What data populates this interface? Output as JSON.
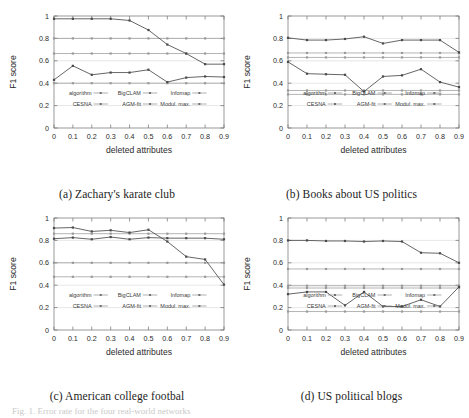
{
  "figure": {
    "caption": "Fig. 1. Error rate for the four real-world networks",
    "legend": {
      "entries": [
        {
          "id": "algorithm",
          "label": "algorithm"
        },
        {
          "id": "bigclam",
          "label": "BigCLAM"
        },
        {
          "id": "infomap",
          "label": "Infomap"
        },
        {
          "id": "cesna",
          "label": "CESNA"
        },
        {
          "id": "agmfit",
          "label": "AGM-fit"
        },
        {
          "id": "modulmax",
          "label": "Modul. max."
        }
      ]
    },
    "axis": {
      "xlabel": "deleted attributes",
      "ylabel": "F1 score",
      "xticks": [
        "0",
        "0.1",
        "0.2",
        "0.3",
        "0.4",
        "0.5",
        "0.6",
        "0.7",
        "0.8",
        "0.9"
      ],
      "yticks": [
        "0",
        "0.2",
        "0.4",
        "0.6",
        "0.8",
        "1"
      ]
    },
    "colors": {
      "line": "#4a4a4a",
      "frame": "#6e6e6e",
      "grid": "#cfcfcf",
      "text": "#2b2b2b"
    }
  },
  "chart_data": [
    {
      "type": "line",
      "panel": "a",
      "title": "(a) Zachary's karate club",
      "xlabel": "deleted attributes",
      "ylabel": "F1 score",
      "x": [
        0,
        0.1,
        0.2,
        0.3,
        0.4,
        0.5,
        0.6,
        0.7,
        0.8,
        0.9
      ],
      "xlim": [
        0,
        0.9
      ],
      "ylim": [
        0,
        1
      ],
      "grid": true,
      "legend_position": "inside-bottom",
      "series": [
        {
          "name": "CESNA",
          "values": [
            0.975,
            0.975,
            0.975,
            0.975,
            0.96,
            0.875,
            0.745,
            0.665,
            0.57,
            0.57
          ]
        },
        {
          "name": "BigCLAM",
          "values": [
            0.43,
            0.555,
            0.475,
            0.495,
            0.495,
            0.52,
            0.41,
            0.45,
            0.46,
            0.455
          ]
        },
        {
          "name": "AGM-fit",
          "values": [
            0.665,
            0.665,
            0.665,
            0.665,
            0.665,
            0.665,
            0.665,
            0.665,
            0.665,
            0.665
          ]
        },
        {
          "name": "Infomap",
          "values": [
            0.8,
            0.8,
            0.8,
            0.8,
            0.8,
            0.8,
            0.8,
            0.8,
            0.8,
            0.8
          ]
        },
        {
          "name": "Modul. max.",
          "values": [
            0.4,
            0.4,
            0.4,
            0.4,
            0.4,
            0.4,
            0.4,
            0.4,
            0.4,
            0.4
          ]
        }
      ]
    },
    {
      "type": "line",
      "panel": "b",
      "title": "(b) Books about US politics",
      "xlabel": "deleted attributes",
      "ylabel": "F1 score",
      "x": [
        0,
        0.1,
        0.2,
        0.3,
        0.4,
        0.5,
        0.6,
        0.7,
        0.8,
        0.9
      ],
      "xlim": [
        0,
        0.9
      ],
      "ylim": [
        0,
        1
      ],
      "grid": true,
      "legend_position": "inside-bottom",
      "series": [
        {
          "name": "CESNA",
          "values": [
            0.805,
            0.785,
            0.785,
            0.795,
            0.815,
            0.755,
            0.785,
            0.785,
            0.785,
            0.675
          ]
        },
        {
          "name": "BigCLAM",
          "values": [
            0.59,
            0.485,
            0.48,
            0.475,
            0.325,
            0.46,
            0.47,
            0.525,
            0.41,
            0.365
          ]
        },
        {
          "name": "AGM-fit",
          "values": [
            0.67,
            0.67,
            0.67,
            0.67,
            0.67,
            0.67,
            0.67,
            0.67,
            0.67,
            0.67
          ]
        },
        {
          "name": "Infomap",
          "values": [
            0.63,
            0.63,
            0.63,
            0.63,
            0.63,
            0.63,
            0.63,
            0.63,
            0.63,
            0.63
          ]
        },
        {
          "name": "Modul. max.",
          "values": [
            0.335,
            0.335,
            0.335,
            0.335,
            0.335,
            0.335,
            0.335,
            0.335,
            0.335,
            0.335
          ]
        },
        {
          "name": "algorithm",
          "values": [
            0.3,
            0.3,
            0.3,
            0.3,
            0.3,
            0.3,
            0.3,
            0.3,
            0.3,
            0.3
          ]
        }
      ]
    },
    {
      "type": "line",
      "panel": "c",
      "title": "(c) American college footbal",
      "xlabel": "deleted attributes",
      "ylabel": "F1 score",
      "x": [
        0,
        0.1,
        0.2,
        0.3,
        0.4,
        0.5,
        0.6,
        0.7,
        0.8,
        0.9
      ],
      "xlim": [
        0,
        0.9
      ],
      "ylim": [
        0,
        1
      ],
      "grid": true,
      "legend_position": "inside-bottom",
      "series": [
        {
          "name": "CESNA",
          "values": [
            0.91,
            0.915,
            0.88,
            0.89,
            0.87,
            0.895,
            0.79,
            0.655,
            0.63,
            0.405
          ]
        },
        {
          "name": "BigCLAM",
          "values": [
            0.815,
            0.825,
            0.81,
            0.83,
            0.81,
            0.825,
            0.82,
            0.82,
            0.82,
            0.81
          ]
        },
        {
          "name": "AGM-fit",
          "values": [
            0.86,
            0.86,
            0.86,
            0.86,
            0.86,
            0.86,
            0.86,
            0.86,
            0.86,
            0.86
          ]
        },
        {
          "name": "Infomap",
          "values": [
            0.6,
            0.6,
            0.6,
            0.6,
            0.6,
            0.6,
            0.6,
            0.6,
            0.6,
            0.6
          ]
        },
        {
          "name": "Modul. max.",
          "values": [
            0.475,
            0.475,
            0.475,
            0.475,
            0.475,
            0.475,
            0.475,
            0.475,
            0.475,
            0.475
          ]
        }
      ]
    },
    {
      "type": "line",
      "panel": "d",
      "title": "(d) US political blogs",
      "xlabel": "deleted attributes",
      "ylabel": "F1 score",
      "x": [
        0,
        0.1,
        0.2,
        0.3,
        0.4,
        0.5,
        0.6,
        0.7,
        0.8,
        0.9
      ],
      "xlim": [
        0,
        0.9
      ],
      "ylim": [
        0,
        1
      ],
      "grid": true,
      "legend_position": "inside-bottom",
      "series": [
        {
          "name": "CESNA",
          "values": [
            0.8,
            0.8,
            0.795,
            0.795,
            0.79,
            0.795,
            0.79,
            0.69,
            0.685,
            0.6
          ]
        },
        {
          "name": "BigCLAM",
          "values": [
            0.32,
            0.34,
            0.34,
            0.22,
            0.34,
            0.21,
            0.21,
            0.27,
            0.21,
            0.385
          ]
        },
        {
          "name": "AGM-fit",
          "values": [
            0.545,
            0.545,
            0.545,
            0.545,
            0.545,
            0.545,
            0.545,
            0.545,
            0.545,
            0.545
          ]
        },
        {
          "name": "Infomap",
          "values": [
            0.395,
            0.395,
            0.395,
            0.395,
            0.395,
            0.395,
            0.395,
            0.395,
            0.395,
            0.395
          ]
        },
        {
          "name": "Modul. max.",
          "values": [
            0.375,
            0.375,
            0.375,
            0.375,
            0.375,
            0.375,
            0.375,
            0.375,
            0.375,
            0.375
          ]
        },
        {
          "name": "algorithm",
          "values": [
            0.165,
            0.165,
            0.165,
            0.165,
            0.165,
            0.165,
            0.165,
            0.165,
            0.165,
            0.165
          ]
        }
      ]
    }
  ]
}
